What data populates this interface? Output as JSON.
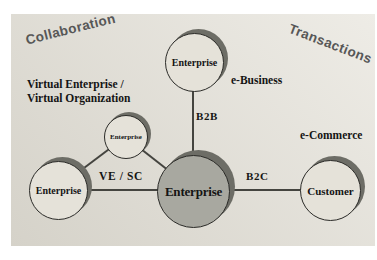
{
  "diagram": {
    "collaboration_label": "Collaboration",
    "transactions_label": "Transactions",
    "virtual_label_line1": "Virtual Enterprise /",
    "virtual_label_line2": "Virtual Organization",
    "e_business_label": "e-Business",
    "e_commerce_label": "e-Commerce",
    "edge_b2b": "B2B",
    "edge_b2c": "B2C",
    "edge_ve_sc": "VE / SC",
    "node_top_enterprise": "Enterprise",
    "node_mini_enterprise": "Enterprise",
    "node_left_enterprise": "Enterprise",
    "node_center_enterprise": "Enterprise",
    "node_customer": "Customer"
  },
  "colors": {
    "panel_light": "#eeece6",
    "panel_dark": "#d5d2c9",
    "node_fill": "#e5e2d9",
    "center_node_fill": "#a8a8a0",
    "shadow": "#6d6d66",
    "line": "#44443f",
    "text": "#141414",
    "corner_text": "#575757"
  }
}
